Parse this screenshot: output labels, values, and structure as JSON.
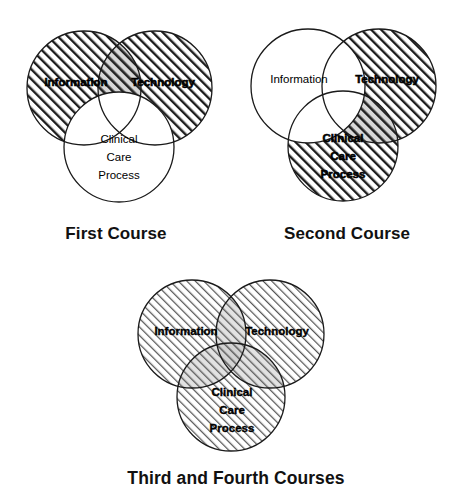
{
  "page": {
    "background_color": "#ffffff",
    "line_color": "#1a1a1a",
    "text_color": "#000000"
  },
  "labels": {
    "information": "Information",
    "technology": "Technology",
    "clinical_line_1": "Clinical",
    "clinical_line_2": "Care",
    "clinical_line_3": "Process"
  },
  "figures": [
    {
      "id": "first-course",
      "caption": "First Course",
      "circles": [
        {
          "name": "information",
          "label": "Information",
          "fill": "hatched-bold",
          "position": "top-left"
        },
        {
          "name": "technology",
          "label": "Technology",
          "fill": "hatched-bold",
          "position": "top-right"
        },
        {
          "name": "clinical-care-process",
          "label": "Clinical Care Process",
          "fill": "none",
          "position": "bottom-center"
        }
      ]
    },
    {
      "id": "second-course",
      "caption": "Second Course",
      "circles": [
        {
          "name": "information",
          "label": "Information",
          "fill": "none",
          "position": "top-left"
        },
        {
          "name": "technology",
          "label": "Technology",
          "fill": "hatched-bold",
          "position": "top-right"
        },
        {
          "name": "clinical-care-process",
          "label": "Clinical Care Process",
          "fill": "hatched-bold",
          "position": "bottom-center"
        }
      ]
    },
    {
      "id": "third-and-fourth-courses",
      "caption": "Third and Fourth Courses",
      "circles": [
        {
          "name": "information",
          "label": "Information",
          "fill": "hatched-light",
          "position": "top-left"
        },
        {
          "name": "technology",
          "label": "Technology",
          "fill": "hatched-light",
          "position": "top-right"
        },
        {
          "name": "clinical-care-process",
          "label": "Clinical Care Process",
          "fill": "hatched-light",
          "position": "bottom-center"
        }
      ]
    }
  ]
}
